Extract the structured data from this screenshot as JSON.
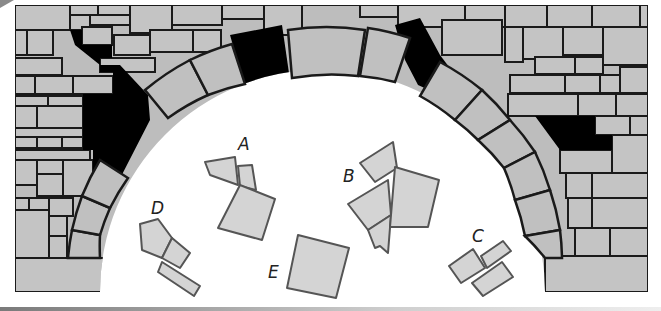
{
  "scene": {
    "title": "Stone arch puzzle",
    "description": "A stone arch wall with missing stones (black gaps); choose which loose piece fits",
    "colors": {
      "stone_fill": "#bdbdbd",
      "stone_highlight": "#d6d6d6",
      "stone_outline": "#1a1a1a",
      "gap_fill": "#000000",
      "piece_fill": "#d2d2d2",
      "piece_outline": "#555555",
      "background": "#ffffff"
    }
  },
  "options": [
    {
      "label": "A",
      "x": 240,
      "y": 150
    },
    {
      "label": "B",
      "x": 345,
      "y": 180
    },
    {
      "label": "C",
      "x": 474,
      "y": 240
    },
    {
      "label": "D",
      "x": 154,
      "y": 212
    },
    {
      "label": "E",
      "x": 271,
      "y": 274
    }
  ]
}
